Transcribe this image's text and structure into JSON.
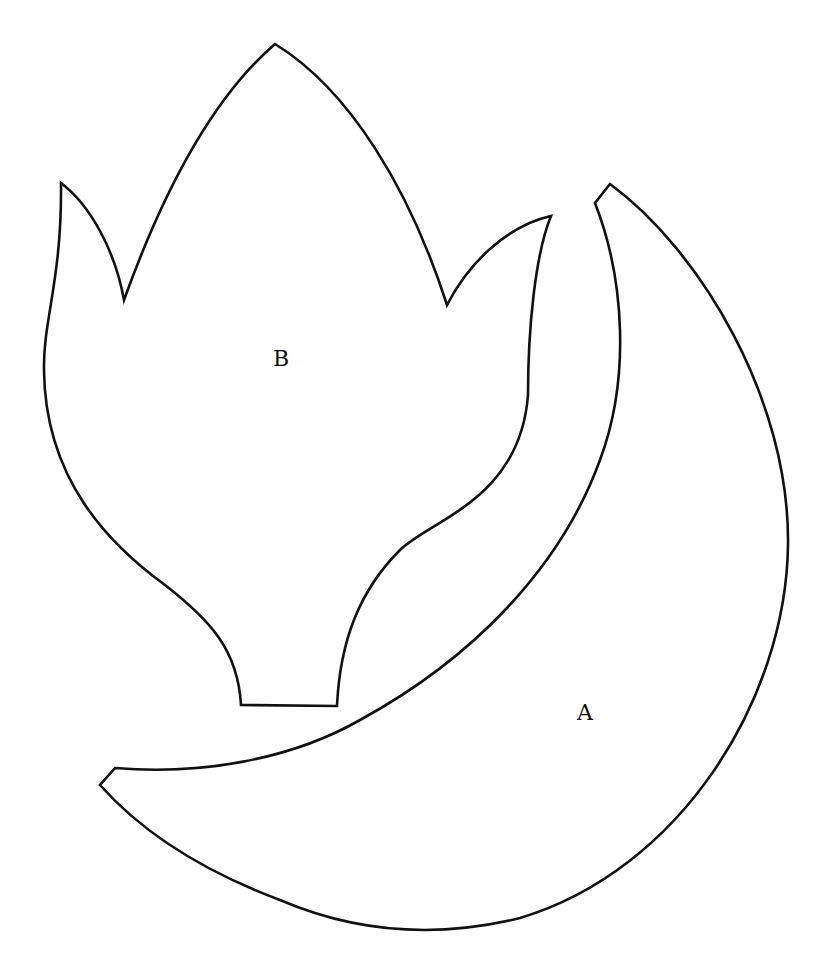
{
  "figure": {
    "type": "pattern-pieces",
    "background": "#ffffff",
    "stroke_color": "#111111",
    "pieces": [
      {
        "id": "A",
        "label": "A",
        "shape": "crescent"
      },
      {
        "id": "B",
        "label": "B",
        "shape": "tulip-flower"
      }
    ]
  }
}
